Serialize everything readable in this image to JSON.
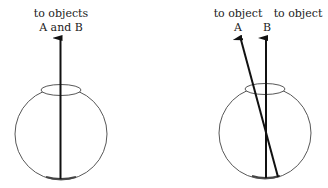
{
  "left_panel": {
    "label_line1": "to objects",
    "label_line2": "A and B"
  },
  "right_panel": {
    "label_a_line1": "to object",
    "label_a_line2": "A",
    "label_b_line1": "to object",
    "label_b_line2": "B"
  },
  "colors": {
    "stroke": "#111111",
    "eye_outline": "#444444",
    "background": "#ffffff"
  }
}
